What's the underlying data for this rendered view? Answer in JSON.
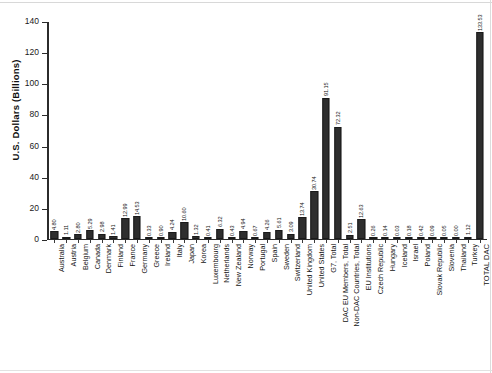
{
  "chart_data": {
    "type": "bar",
    "title": "",
    "xlabel": "",
    "ylabel": "U.S. Dollars (Billions)",
    "ylim": [
      0,
      140
    ],
    "yticks": [
      0,
      20,
      40,
      60,
      80,
      100,
      120,
      140
    ],
    "ytick_labels": [
      "0",
      "20",
      "40",
      "60",
      "80",
      "100",
      "120",
      "140"
    ],
    "grid": false,
    "legend": null,
    "bar_color": "#2e2e2e",
    "value_labels_shown": true,
    "categories": [
      "Australia",
      "Austria",
      "Belgium",
      "Canada",
      "Denmark",
      "Finland",
      "France",
      "Germany",
      "Greece",
      "Ireland",
      "Italy",
      "Japan",
      "Korea",
      "Luxembourg",
      "Netherlands",
      "New Zealand",
      "Norway",
      "Portugal",
      "Spain",
      "Sweden",
      "Switzerland",
      "United Kingdom",
      "United States",
      "G7, Total",
      "DAC EU Members, Total",
      "Non-DAC Countries, Total",
      "EU Institutions",
      "Czech Republic",
      "Hungary",
      "Iceland",
      "Israel",
      "Poland",
      "Slovak Republic",
      "Slovenia",
      "Thailand",
      "Turkey",
      "TOTAL DAC"
    ],
    "values": [
      4.8,
      1.11,
      2.8,
      5.29,
      2.98,
      1.41,
      12.99,
      14.53,
      0.33,
      0.9,
      4.24,
      10.6,
      1.32,
      0.41,
      6.32,
      0.43,
      4.94,
      0.67,
      4.26,
      5.61,
      3.09,
      13.74,
      30.74,
      91.15,
      72.32,
      2.51,
      12.63,
      0.26,
      0.14,
      0.03,
      0.18,
      0.42,
      0.09,
      0.05,
      0.0,
      1.12,
      133.53
    ],
    "value_labels": [
      "4.80",
      "1.11",
      "2.80",
      "5.29",
      "2.98",
      "1.41",
      "12.99",
      "14.53",
      "0.33",
      "0.90",
      "4.24",
      "10.60",
      "1.32",
      "0.41",
      "6.32",
      "0.43",
      "4.94",
      "0.67",
      "4.26",
      "5.61",
      "3.09",
      "13.74",
      "30.74",
      "91.15",
      "72.32",
      "2.51",
      "12.63",
      "0.26",
      "0.14",
      "0.03",
      "0.18",
      "0.42",
      "0.09",
      "0.05",
      "0.00",
      "1.12",
      "133.53"
    ]
  }
}
